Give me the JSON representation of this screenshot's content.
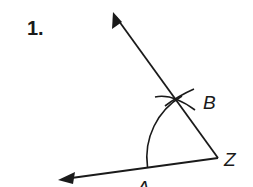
{
  "problem": {
    "number": "1."
  },
  "diagram": {
    "type": "angle-copy-construction",
    "stroke_color": "#1a1a1a",
    "labels": {
      "vertex": "Z",
      "point_on_ray1": "B",
      "point_on_ray2": "A"
    },
    "rays": [
      {
        "name": "ray-ZB",
        "from": [
          218,
          158
        ],
        "to": [
          113,
          12
        ]
      },
      {
        "name": "ray-ZA",
        "from": [
          218,
          158
        ],
        "to": [
          58,
          180
        ]
      }
    ],
    "arc": {
      "center": "Z",
      "from": "A",
      "through": "B"
    },
    "intersection_arc": {
      "at": "B"
    }
  }
}
